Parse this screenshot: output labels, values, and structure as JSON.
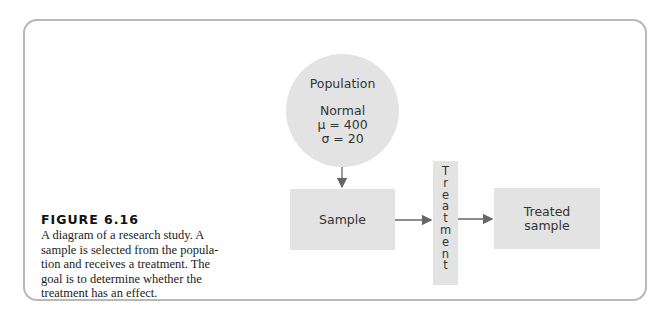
{
  "figure": {
    "label": "FIGURE 6.16",
    "caption_lines": [
      "A diagram of a research study. A",
      "sample is selected from the popula-",
      "tion and receives a treatment. The",
      "goal is to determine whether the",
      "treatment has an effect."
    ]
  },
  "diagram": {
    "population": {
      "title": "Population",
      "distribution": "Normal",
      "mean": "μ = 400",
      "sd": "σ = 20"
    },
    "sample": {
      "label": "Sample"
    },
    "treatment": {
      "label": "Treatment",
      "letters": [
        "T",
        "r",
        "e",
        "a",
        "t",
        "m",
        "e",
        "n",
        "t"
      ]
    },
    "treated_sample": {
      "line1": "Treated",
      "line2": "sample"
    },
    "colors": {
      "shape_fill": "#e3e3e3",
      "arrow": "#666666",
      "border": "#b8b8b8"
    }
  }
}
